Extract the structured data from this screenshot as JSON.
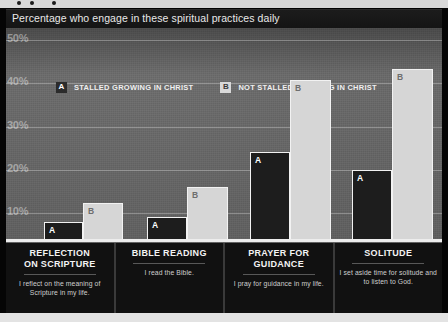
{
  "chart_data": {
    "type": "bar",
    "title": "Percentage who engage in these spiritual practices daily",
    "xlabel": "",
    "ylabel": "",
    "ylim": [
      0,
      50
    ],
    "yticks": [
      "10%",
      "20%",
      "30%",
      "40%",
      "50%"
    ],
    "ytick_values": [
      10,
      20,
      30,
      40,
      50
    ],
    "grid": true,
    "legend_position": "top-left",
    "categories": [
      "REFLECTION ON SCRIPTURE",
      "BIBLE READING",
      "PRAYER FOR GUIDANCE",
      "SOLITUDE"
    ],
    "series": [
      {
        "name": "STALLED GROWING IN CHRIST",
        "key": "A",
        "color": "#1d1d1d",
        "values": [
          4,
          5,
          21,
          17
        ]
      },
      {
        "name": "NOT STALLED GROWING IN CHRIST",
        "key": "B",
        "color": "#d6d6d6",
        "values": [
          9,
          13,
          38,
          41
        ]
      }
    ]
  },
  "header": {
    "title": "Percentage who engage in these spiritual practices daily"
  },
  "legend": {
    "items": [
      {
        "key": "A",
        "label": "STALLED GROWING IN CHRIST"
      },
      {
        "key": "B",
        "label": "NOT STALLED GROWING IN CHRIST"
      }
    ]
  },
  "axis": {
    "yticks": [
      {
        "label": "50%",
        "top": 4
      },
      {
        "label": "40%",
        "top": 47
      },
      {
        "label": "30%",
        "top": 91
      },
      {
        "label": "20%",
        "top": 134
      },
      {
        "label": "10%",
        "top": 177
      }
    ],
    "gridlines": [
      12,
      55,
      99,
      142,
      185
    ]
  },
  "groups": [
    {
      "title": "REFLECTION ON SCRIPTURE",
      "title_line1": "REFLECTION",
      "title_line2": "ON SCRIPTURE",
      "subtitle": "I reflect on the meaning of Scripture in my life.",
      "bars": [
        {
          "key": "A",
          "value": 4,
          "left": 38,
          "width": 39,
          "top": 194
        },
        {
          "key": "B",
          "value": 9,
          "left": 77,
          "width": 40,
          "top": 175
        }
      ]
    },
    {
      "title": "BIBLE READING",
      "title_line1": "BIBLE READING",
      "title_line2": "",
      "subtitle": "I read the Bible.",
      "bars": [
        {
          "key": "A",
          "value": 5,
          "left": 141,
          "width": 40,
          "top": 189
        },
        {
          "key": "B",
          "value": 13,
          "left": 181,
          "width": 41,
          "top": 159
        }
      ]
    },
    {
      "title": "PRAYER FOR GUIDANCE",
      "title_line1": "PRAYER FOR",
      "title_line2": "GUIDANCE",
      "subtitle": "I pray for guidance in my life.",
      "bars": [
        {
          "key": "A",
          "value": 21,
          "left": 244,
          "width": 40,
          "top": 124
        },
        {
          "key": "B",
          "value": 38,
          "left": 284,
          "width": 41,
          "top": 52
        }
      ]
    },
    {
      "title": "SOLITUDE",
      "title_line1": "SOLITUDE",
      "title_line2": "",
      "subtitle": "I set aside time for solitude and to listen to God.",
      "bars": [
        {
          "key": "A",
          "value": 17,
          "left": 346,
          "width": 40,
          "top": 142
        },
        {
          "key": "B",
          "value": 41,
          "left": 386,
          "width": 41,
          "top": 41
        }
      ]
    }
  ]
}
